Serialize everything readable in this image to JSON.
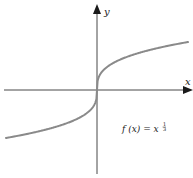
{
  "chart_data": {
    "type": "line",
    "title": "",
    "function": "f(x) = x^(1/3)",
    "annotation": {
      "text_base": "f (x) = x",
      "exponent_numerator": "1",
      "exponent_denominator": "3"
    },
    "xlabel": "x",
    "ylabel": "y",
    "xlim": [
      -3.5,
      3.5
    ],
    "ylim": [
      -3.5,
      3.5
    ],
    "grid": false,
    "legend": false,
    "ticks": false,
    "series": [
      {
        "name": "f(x) = x^(1/3)",
        "x": [
          -3.4,
          -3,
          -2.5,
          -2,
          -1.5,
          -1,
          -0.5,
          -0.2,
          -0.05,
          0,
          0.05,
          0.2,
          0.5,
          1,
          1.5,
          2,
          2.5,
          3,
          3.4
        ],
        "y": [
          -1.504,
          -1.442,
          -1.357,
          -1.26,
          -1.145,
          -1.0,
          -0.794,
          -0.585,
          -0.368,
          0,
          0.368,
          0.585,
          0.794,
          1.0,
          1.145,
          1.26,
          1.357,
          1.442,
          1.504
        ]
      }
    ],
    "colors": {
      "curve": "#8a8a8a",
      "axes": "#1a1a1a"
    }
  }
}
